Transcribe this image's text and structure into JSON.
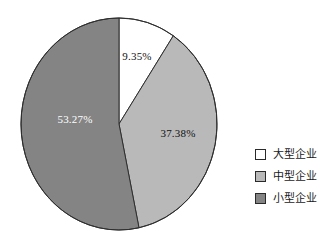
{
  "chart_data": {
    "type": "pie",
    "title": "",
    "subtitle": "",
    "xlabel": "",
    "ylabel": "",
    "grid": false,
    "legend_position": "right",
    "start_angle_deg": 0,
    "direction": "clockwise",
    "categories": [
      "大型企业",
      "中型企业",
      "小型企业"
    ],
    "values": [
      9.35,
      37.38,
      53.27
    ],
    "value_labels": [
      "9.35%",
      "37.38%",
      "53.27%"
    ],
    "slice_colors": [
      "#ffffff",
      "#b9b9b9",
      "#848484"
    ],
    "slice_label_colors": [
      "#111111",
      "#111111",
      "#ffffff"
    ],
    "total": 100.0
  },
  "pie": {
    "center_x": 119,
    "center_y": 124,
    "radius_x": 98,
    "radius_y": 106,
    "outline_color": "#2f2f2f",
    "slices": [
      {
        "name": "大型企业",
        "label": "9.35%",
        "value": 9.35,
        "color": "#ffffff",
        "label_color": "#111111",
        "label_x": 137,
        "label_y": 56
      },
      {
        "name": "中型企业",
        "label": "37.38%",
        "value": 37.38,
        "color": "#b9b9b9",
        "label_color": "#111111",
        "label_x": 178,
        "label_y": 133
      },
      {
        "name": "小型企业",
        "label": "53.27%",
        "value": 53.27,
        "color": "#848484",
        "label_color": "#ffffff",
        "label_x": 75,
        "label_y": 119
      }
    ]
  },
  "legend": {
    "items": [
      {
        "label": "大型企业",
        "color": "#ffffff"
      },
      {
        "label": "中型企业",
        "color": "#b9b9b9"
      },
      {
        "label": "小型企业",
        "color": "#848484"
      }
    ]
  }
}
